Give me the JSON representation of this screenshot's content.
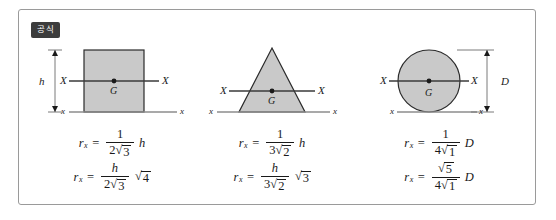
{
  "card": {
    "badge_label": "공식"
  },
  "figures": [
    {
      "id": "rectangle",
      "shape_name": "rectangle",
      "centroid_label": "G",
      "axis_left_label": "X",
      "axis_right_label": "X",
      "base_left_label": "x",
      "base_right_label": "x",
      "dimension_label": "h",
      "formulas": [
        {
          "lhs_var": "r",
          "lhs_sub": "x",
          "equals": "=",
          "numerator": "1",
          "denominator_coefficient": "2",
          "denominator_radicand": "3",
          "tail_type": "variable",
          "tail": "h"
        },
        {
          "lhs_var": "r",
          "lhs_sub": "x",
          "equals": "=",
          "numerator": "h",
          "denominator_coefficient": "2",
          "denominator_radicand": "3",
          "tail_type": "radical",
          "tail": "4"
        }
      ]
    },
    {
      "id": "triangle",
      "shape_name": "triangle",
      "centroid_label": "G",
      "axis_left_label": "X",
      "axis_right_label": "X",
      "base_left_label": "x",
      "base_right_label": "x",
      "dimension_label": "",
      "formulas": [
        {
          "lhs_var": "r",
          "lhs_sub": "x",
          "equals": "=",
          "numerator": "1",
          "denominator_coefficient": "3",
          "denominator_radicand": "2",
          "tail_type": "variable",
          "tail": "h"
        },
        {
          "lhs_var": "r",
          "lhs_sub": "x",
          "equals": "=",
          "numerator": "h",
          "denominator_coefficient": "3",
          "denominator_radicand": "2",
          "tail_type": "radical",
          "tail": "3"
        }
      ]
    },
    {
      "id": "circle",
      "shape_name": "circle",
      "centroid_label": "G",
      "axis_left_label": "X",
      "axis_right_label": "X",
      "base_left_label": "x",
      "base_right_label": "x",
      "dimension_label": "D",
      "formulas": [
        {
          "lhs_var": "r",
          "lhs_sub": "x",
          "equals": "=",
          "numerator": "1",
          "denominator_coefficient": "4",
          "denominator_radicand": "1",
          "tail_type": "variable",
          "tail": "D"
        },
        {
          "lhs_var": "r",
          "lhs_sub": "x",
          "equals": "=",
          "numerator_radical": "5",
          "denominator_coefficient": "4",
          "denominator_radicand": "1",
          "tail_type": "variable",
          "tail": "D"
        }
      ]
    }
  ],
  "colors": {
    "shape_fill": "#c9c9c9",
    "shape_stroke": "#2b2b2b",
    "card_border": "#9a9a9a",
    "badge_bg": "#3c3c3c",
    "badge_text": "#ffffff",
    "text": "#1a1a1a"
  },
  "glyphs": {
    "radical": "√"
  }
}
